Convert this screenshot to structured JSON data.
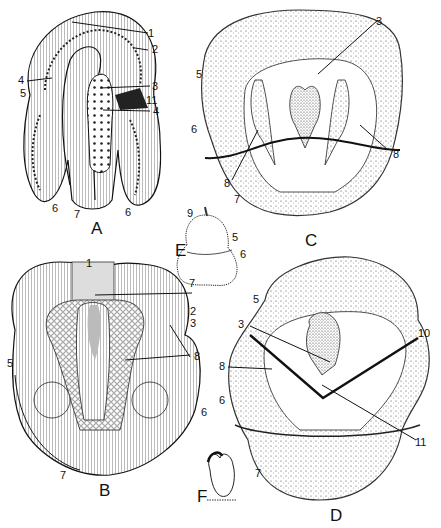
{
  "figure": {
    "panels": {
      "A": {
        "letter": "A",
        "labels": [
          "1",
          "2",
          "3",
          "4",
          "4",
          "5",
          "11",
          "6",
          "7",
          "6"
        ]
      },
      "B": {
        "letter": "B",
        "labels": [
          "1",
          "2",
          "3",
          "8",
          "5",
          "6",
          "7"
        ]
      },
      "C": {
        "letter": "C",
        "labels": [
          "3",
          "5",
          "6",
          "8",
          "8",
          "7"
        ]
      },
      "D": {
        "letter": "D",
        "labels": [
          "5",
          "3",
          "10",
          "8",
          "6",
          "11",
          "7"
        ]
      },
      "E": {
        "letter": "E",
        "labels": [
          "9",
          "5",
          "6",
          "7"
        ]
      },
      "F": {
        "letter": "F"
      }
    },
    "colors": {
      "ink": "#111111",
      "paper": "#ffffff",
      "stipple": "#555555"
    }
  }
}
